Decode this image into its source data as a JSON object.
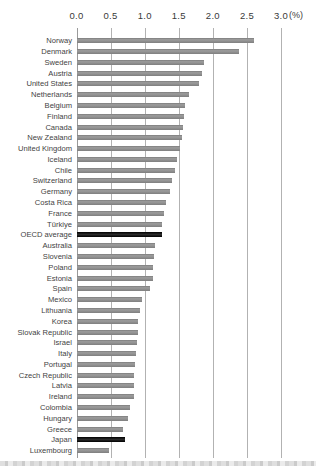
{
  "chart_data": {
    "type": "bar",
    "orientation": "horizontal",
    "title": "",
    "xlabel": "(%)",
    "ylabel": "",
    "xlim": [
      0.0,
      3.0
    ],
    "xticks": [
      0.0,
      0.5,
      1.0,
      1.5,
      2.0,
      2.5,
      3.0
    ],
    "xtick_labels": [
      "0.0",
      "0.5",
      "1.0",
      "1.5",
      "2.0",
      "2.5",
      "3.0"
    ],
    "unit_label": "(%)",
    "grid": true,
    "legend": false,
    "rows": [
      {
        "label": "Norway",
        "value": 2.59,
        "highlight": false
      },
      {
        "label": "Denmark",
        "value": 2.38,
        "highlight": false
      },
      {
        "label": "Sweden",
        "value": 1.86,
        "highlight": false
      },
      {
        "label": "Austria",
        "value": 1.83,
        "highlight": false
      },
      {
        "label": "United States",
        "value": 1.79,
        "highlight": false
      },
      {
        "label": "Netherlands",
        "value": 1.64,
        "highlight": false
      },
      {
        "label": "Belgium",
        "value": 1.59,
        "highlight": false
      },
      {
        "label": "Finland",
        "value": 1.57,
        "highlight": false
      },
      {
        "label": "Canada",
        "value": 1.56,
        "highlight": false
      },
      {
        "label": "New Zealand",
        "value": 1.54,
        "highlight": false
      },
      {
        "label": "United Kingdom",
        "value": 1.51,
        "highlight": false
      },
      {
        "label": "Iceland",
        "value": 1.46,
        "highlight": false
      },
      {
        "label": "Chile",
        "value": 1.44,
        "highlight": false
      },
      {
        "label": "Switzerland",
        "value": 1.39,
        "highlight": false
      },
      {
        "label": "Germany",
        "value": 1.36,
        "highlight": false
      },
      {
        "label": "Costa Rica",
        "value": 1.3,
        "highlight": false
      },
      {
        "label": "France",
        "value": 1.28,
        "highlight": false
      },
      {
        "label": "Türkiye",
        "value": 1.25,
        "highlight": false
      },
      {
        "label": "OECD average",
        "value": 1.24,
        "highlight": true
      },
      {
        "label": "Australia",
        "value": 1.14,
        "highlight": false
      },
      {
        "label": "Slovenia",
        "value": 1.13,
        "highlight": false
      },
      {
        "label": "Poland",
        "value": 1.12,
        "highlight": false
      },
      {
        "label": "Estonia",
        "value": 1.11,
        "highlight": false
      },
      {
        "label": "Spain",
        "value": 1.07,
        "highlight": false
      },
      {
        "label": "Mexico",
        "value": 0.95,
        "highlight": false
      },
      {
        "label": "Lithuania",
        "value": 0.92,
        "highlight": false
      },
      {
        "label": "Korea",
        "value": 0.9,
        "highlight": false
      },
      {
        "label": "Slovak Republic",
        "value": 0.89,
        "highlight": false
      },
      {
        "label": "Israel",
        "value": 0.88,
        "highlight": false
      },
      {
        "label": "Italy",
        "value": 0.86,
        "highlight": false
      },
      {
        "label": "Portugal",
        "value": 0.85,
        "highlight": false
      },
      {
        "label": "Czech Republic",
        "value": 0.84,
        "highlight": false
      },
      {
        "label": "Latvia",
        "value": 0.83,
        "highlight": false
      },
      {
        "label": "Ireland",
        "value": 0.83,
        "highlight": false
      },
      {
        "label": "Colombia",
        "value": 0.77,
        "highlight": false
      },
      {
        "label": "Hungary",
        "value": 0.74,
        "highlight": false
      },
      {
        "label": "Greece",
        "value": 0.68,
        "highlight": false
      },
      {
        "label": "Japan",
        "value": 0.7,
        "highlight": true
      },
      {
        "label": "Luxembourg",
        "value": 0.47,
        "highlight": false
      }
    ],
    "colors": {
      "bar": "#8e8e8e",
      "highlight_bar": "#111111",
      "gridline": "#b2b2b2",
      "label_text": "#3f3f3f"
    }
  }
}
